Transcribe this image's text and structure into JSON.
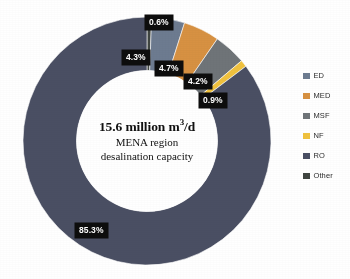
{
  "chart_data": {
    "type": "pie",
    "subtype": "donut",
    "title": "",
    "categories": [
      "ED",
      "MED",
      "MSF",
      "NF",
      "RO",
      "Other"
    ],
    "values": [
      4.3,
      4.7,
      4.2,
      0.9,
      85.3,
      0.6
    ],
    "value_labels": [
      "4.3%",
      "4.7%",
      "4.2%",
      "0.9%",
      "85.3%",
      "0.6%"
    ],
    "units": "percent",
    "colors": [
      "#6d7b90",
      "#d79142",
      "#6f7478",
      "#f0c23e",
      "#4a4f63",
      "#3f4540"
    ],
    "legend_position": "right",
    "grid": false,
    "start_angle_deg": 0,
    "direction": "clockwise",
    "center_text": {
      "headline_value": "15.6",
      "headline_unit_pre": " million m",
      "headline_exponent": "3",
      "headline_unit_post": "/d",
      "headline_full": "15.6 million m3/d",
      "line2": "MENA region",
      "line3": "desalination capacity"
    },
    "slices": [
      {
        "name": "Other",
        "label": "0.6%",
        "value": 0.6,
        "color": "#3f4540"
      },
      {
        "name": "ED",
        "label": "4.3%",
        "value": 4.3,
        "color": "#6d7b90"
      },
      {
        "name": "MED",
        "label": "4.7%",
        "value": 4.7,
        "color": "#d79142"
      },
      {
        "name": "MSF",
        "label": "4.2%",
        "value": 4.2,
        "color": "#6f7478"
      },
      {
        "name": "NF",
        "label": "0.9%",
        "value": 0.9,
        "color": "#f0c23e"
      },
      {
        "name": "RO",
        "label": "85.3%",
        "value": 85.3,
        "color": "#4a4f63"
      }
    ]
  },
  "center": {
    "headline_value": "15.6 million m",
    "headline_exponent": "3",
    "headline_suffix": "/d",
    "line2": "MENA region",
    "line3": "desalination capacity"
  },
  "callouts": {
    "other": "0.6%",
    "ed": "4.3%",
    "med": "4.7%",
    "msf": "4.2%",
    "nf": "0.9%",
    "ro": "85.3%"
  },
  "legend": {
    "items": [
      {
        "label": "ED",
        "color": "#6d7b90"
      },
      {
        "label": "MED",
        "color": "#d79142"
      },
      {
        "label": "MSF",
        "color": "#6f7478"
      },
      {
        "label": "NF",
        "color": "#f0c23e"
      },
      {
        "label": "RO",
        "color": "#4a4f63"
      },
      {
        "label": "Other",
        "color": "#3f4540"
      }
    ]
  }
}
